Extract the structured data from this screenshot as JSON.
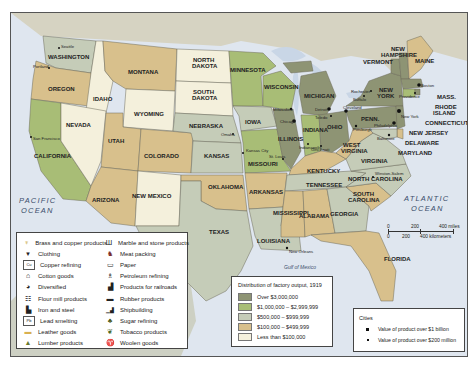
{
  "title": "Distribution of factory output, 1919",
  "oceans": {
    "pacific": [
      "PACIFIC",
      "OCEAN"
    ],
    "atlantic": [
      "ATLANTIC",
      "OCEAN"
    ],
    "gulf": "Gulf of Mexico"
  },
  "colors": {
    "over_3m": "#8e9474",
    "1m_3m": "#a8bd76",
    "500k_1m": "#c5ccb8",
    "100k_500k": "#d8c08c",
    "under_100k": "#f4f0dc",
    "water": "#dfe6ef",
    "canada": "#d6d3c2",
    "mexico": "#cdd0c3"
  },
  "states": [
    {
      "name": "WASHINGTON",
      "tier": "500k_1m",
      "industry": "Lumber products"
    },
    {
      "name": "OREGON",
      "tier": "100k_500k",
      "industry": "Lumber products"
    },
    {
      "name": "CALIFORNIA",
      "tier": "1m_3m",
      "industry": "Diversified"
    },
    {
      "name": "IDAHO",
      "tier": "under_100k",
      "industry": "Lumber products"
    },
    {
      "name": "NEVADA",
      "tier": "under_100k",
      "industry": "Products for railroads"
    },
    {
      "name": "MONTANA",
      "tier": "100k_500k",
      "industry": "Flour mill products"
    },
    {
      "name": "WYOMING",
      "tier": "under_100k",
      "industry": "Products for railroads"
    },
    {
      "name": "UTAH",
      "tier": "100k_500k",
      "industry": "Lead smelting"
    },
    {
      "name": "ARIZONA",
      "tier": "100k_500k",
      "industry": "Copper refining"
    },
    {
      "name": "COLORADO",
      "tier": "100k_500k",
      "industry": "Meat packing"
    },
    {
      "name": "NEW MEXICO",
      "tier": "under_100k",
      "industry": "Products for railroads"
    },
    {
      "name": "NORTH DAKOTA",
      "tier": "under_100k",
      "industry": "Flour mill products"
    },
    {
      "name": "SOUTH DAKOTA",
      "tier": "under_100k",
      "industry": "Flour mill products"
    },
    {
      "name": "NEBRASKA",
      "tier": "500k_1m",
      "industry": "Meat packing"
    },
    {
      "name": "KANSAS",
      "tier": "500k_1m",
      "industry": "Meat packing"
    },
    {
      "name": "OKLAHOMA",
      "tier": "100k_500k",
      "industry": "Petroleum refining"
    },
    {
      "name": "TEXAS",
      "tier": "500k_1m",
      "industry": "Petroleum refining"
    },
    {
      "name": "MINNESOTA",
      "tier": "1m_3m",
      "industry": "Flour mill products"
    },
    {
      "name": "IOWA",
      "tier": "500k_1m",
      "industry": "Meat packing"
    },
    {
      "name": "MISSOURI",
      "tier": "1m_3m",
      "industry": "Meat packing"
    },
    {
      "name": "ARKANSAS",
      "tier": "100k_500k",
      "industry": "Lumber products"
    },
    {
      "name": "LOUISIANA",
      "tier": "500k_1m",
      "industry": "Sugar refining"
    },
    {
      "name": "WISCONSIN",
      "tier": "1m_3m",
      "industry": "Diversified"
    },
    {
      "name": "ILLINOIS",
      "tier": "over_3m",
      "industry": "Meat packing"
    },
    {
      "name": "MICHIGAN",
      "tier": "over_3m",
      "industry": "Diversified"
    },
    {
      "name": "INDIANA",
      "tier": "1m_3m",
      "industry": "Iron and steel"
    },
    {
      "name": "OHIO",
      "tier": "over_3m",
      "industry": "Iron and steel, Rubber products"
    },
    {
      "name": "KENTUCKY",
      "tier": "100k_500k",
      "industry": "Tobacco products"
    },
    {
      "name": "TENNESSEE",
      "tier": "500k_1m",
      "industry": "Tobacco products"
    },
    {
      "name": "MISSISSIPPI",
      "tier": "100k_500k",
      "industry": "Lumber products"
    },
    {
      "name": "ALABAMA",
      "tier": "100k_500k",
      "industry": "Cotton goods"
    },
    {
      "name": "GEORGIA",
      "tier": "500k_1m",
      "industry": "Cotton goods"
    },
    {
      "name": "FLORIDA",
      "tier": "100k_500k",
      "industry": "Lumber products"
    },
    {
      "name": "SOUTH CAROLINA",
      "tier": "100k_500k",
      "industry": "Cotton goods"
    },
    {
      "name": "NORTH CAROLINA",
      "tier": "500k_1m",
      "industry": "Tobacco products"
    },
    {
      "name": "VIRGINIA",
      "tier": "500k_1m",
      "industry": "Cotton goods"
    },
    {
      "name": "WEST VIRGINIA",
      "tier": "100k_500k",
      "industry": "Iron and steel"
    },
    {
      "name": "PENN.",
      "tier": "over_3m",
      "industry": "Iron and steel"
    },
    {
      "name": "NEW YORK",
      "tier": "over_3m",
      "industry": "Clothing"
    },
    {
      "name": "VERMONT",
      "tier": "over_3m",
      "industry": "Marble and stone products"
    },
    {
      "name": "NEW HAMPSHIRE",
      "tier": "over_3m",
      "industry": "Cotton goods"
    },
    {
      "name": "MAINE",
      "tier": "100k_500k",
      "industry": "Paper"
    },
    {
      "name": "MASS.",
      "tier": "over_3m",
      "industry": "Cotton goods"
    },
    {
      "name": "RHODE ISLAND",
      "tier": "over_3m",
      "industry": "Cotton goods, Woolen goods"
    },
    {
      "name": "CONNECTICUT",
      "tier": "1m_3m",
      "industry": "Brass and copper products"
    },
    {
      "name": "NEW JERSEY",
      "tier": "over_3m",
      "industry": "Diversified"
    },
    {
      "name": "DELAWARE",
      "tier": "100k_500k",
      "industry": "Leather goods"
    },
    {
      "name": "MARYLAND",
      "tier": "500k_1m",
      "industry": "Shipbuilding, Clothing"
    }
  ],
  "cities": [
    "Seattle",
    "Portland",
    "San Francisco",
    "Omaha",
    "Kansas City",
    "St. Louis",
    "Milwaukee",
    "Chicago",
    "Detroit",
    "Toledo",
    "Cleveland",
    "Cincinnati",
    "Indianapolis",
    "Buffalo",
    "Rochester",
    "Pittsburgh",
    "Philadelphia",
    "New York",
    "Boston",
    "Providence",
    "Baltimore",
    "Winston-Salem",
    "New Orleans"
  ],
  "industry_legend": {
    "left": [
      {
        "icon": "brass-copper-icon",
        "glyph": "♆",
        "label": "Brass and copper products"
      },
      {
        "icon": "clothing-icon",
        "glyph": "👕",
        "label": "Clothing"
      },
      {
        "icon": "copper-refining-icon",
        "glyph": "Cu",
        "label": "Copper refining"
      },
      {
        "icon": "cotton-goods-icon",
        "glyph": "⌂",
        "label": "Cotton goods"
      },
      {
        "icon": "diversified-icon",
        "glyph": "◕",
        "label": "Diversified"
      },
      {
        "icon": "flour-mill-icon",
        "glyph": "☷",
        "label": "Flour mill products"
      },
      {
        "icon": "iron-steel-icon",
        "glyph": "▙",
        "label": "Iron and steel"
      },
      {
        "icon": "lead-smelting-icon",
        "glyph": "Pb",
        "label": "Lead smelting"
      },
      {
        "icon": "leather-goods-icon",
        "glyph": "▬",
        "label": "Leather goods"
      },
      {
        "icon": "lumber-icon",
        "glyph": "▲",
        "label": "Lumber products"
      }
    ],
    "right": [
      {
        "icon": "marble-stone-icon",
        "glyph": "Ш",
        "label": "Marble and stone products"
      },
      {
        "icon": "meat-packing-icon",
        "glyph": "♞",
        "label": "Meat packing"
      },
      {
        "icon": "paper-icon",
        "glyph": "▭",
        "label": "Paper"
      },
      {
        "icon": "petroleum-icon",
        "glyph": "♗",
        "label": "Petroleum refining"
      },
      {
        "icon": "railroad-icon",
        "glyph": "▟",
        "label": "Products for railroads"
      },
      {
        "icon": "rubber-icon",
        "glyph": "▬",
        "label": "Rubber products"
      },
      {
        "icon": "shipbuilding-icon",
        "glyph": "⛴",
        "label": "Shipbuilding"
      },
      {
        "icon": "sugar-icon",
        "glyph": "♣",
        "label": "Sugar refining"
      },
      {
        "icon": "tobacco-icon",
        "glyph": "❦",
        "label": "Tobacco products"
      },
      {
        "icon": "woolen-icon",
        "glyph": "♈",
        "label": "Woolen goods"
      }
    ]
  },
  "distribution_legend": {
    "title": "Distribution of factory output, 1919",
    "items": [
      {
        "label": "Over $3,000,000",
        "color": "#8e9474"
      },
      {
        "label": "$1,000,000 – $2,999,999",
        "color": "#a8bd76"
      },
      {
        "label": "$500,000 – $999,999",
        "color": "#c5ccb8"
      },
      {
        "label": "$100,000 – $499,999",
        "color": "#d8c08c"
      },
      {
        "label": "Less than $100,000",
        "color": "#f4f0dc"
      }
    ]
  },
  "cities_legend": {
    "title": "Cities",
    "items": [
      {
        "label": "Value of product over $1 billion",
        "size": 4
      },
      {
        "label": "Value of product over $200 million",
        "size": 2
      }
    ]
  },
  "scale": {
    "miles": [
      "0",
      "200",
      "400 miles"
    ],
    "km": [
      "0",
      "200",
      "400 kilometers"
    ]
  }
}
